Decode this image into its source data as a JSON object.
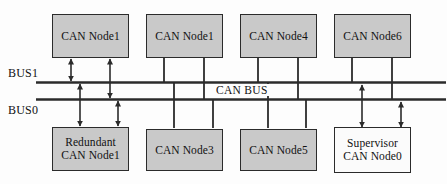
{
  "diagram": {
    "background_color": "#fdfdfd",
    "node_fill_color": "#c9c9c9",
    "node_fill_color_white": "#fbfbfb",
    "line_color": "#2b2b2b",
    "bus_label_center": "CAN BUS",
    "bus_lines": [
      {
        "name": "BUS1",
        "label": "BUS1"
      },
      {
        "name": "BUS0",
        "label": "BUS0"
      }
    ],
    "nodes_top": [
      {
        "id": "node-top-1",
        "label": "CAN Node1",
        "fill": "gray"
      },
      {
        "id": "node-top-2",
        "label": "CAN Node1",
        "fill": "gray"
      },
      {
        "id": "node-top-3",
        "label": "CAN Node4",
        "fill": "gray"
      },
      {
        "id": "node-top-4",
        "label": "CAN Node6",
        "fill": "gray"
      }
    ],
    "nodes_bottom": [
      {
        "id": "node-bottom-1",
        "label": "Redundant\nCAN Node1",
        "fill": "gray"
      },
      {
        "id": "node-bottom-2",
        "label": "CAN Node3",
        "fill": "gray"
      },
      {
        "id": "node-bottom-3",
        "label": "CAN Node5",
        "fill": "gray"
      },
      {
        "id": "node-bottom-4",
        "label": "Supervisor\nCAN Node0",
        "fill": "white"
      }
    ]
  }
}
